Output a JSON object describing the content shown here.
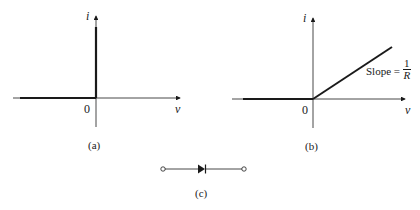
{
  "panels": [
    {
      "id": "a",
      "caption": "(a)",
      "y_axis_label": "i",
      "x_axis_label": "v",
      "origin_label": "0",
      "description": "Ideal diode i-v characteristic: zero current for v<0, vertical line at v=0"
    },
    {
      "id": "b",
      "caption": "(b)",
      "y_axis_label": "i",
      "x_axis_label": "v",
      "origin_label": "0",
      "slope_label": "Slope =",
      "slope_numerator": "1",
      "slope_denominator": "R",
      "description": "Diode with series resistance: zero current for v<0, line with slope 1/R for v>0"
    },
    {
      "id": "c",
      "caption": "(c)",
      "description": "Diode circuit symbol between two terminals"
    }
  ],
  "colors": {
    "ink": "#1a1a1a",
    "background": "#ffffff"
  }
}
